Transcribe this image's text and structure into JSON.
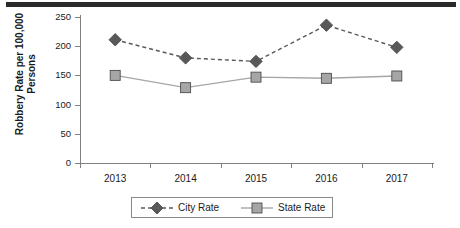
{
  "decor": {
    "top_bar_color": "#2b2b2b"
  },
  "chart_data": {
    "type": "line",
    "title": "",
    "xlabel": "",
    "ylabel": "Robbery Rate per 100,000 Persons",
    "ylabel_line1": "Robbery Rate per 100,000",
    "ylabel_line2": "Persons",
    "categories": [
      "2013",
      "2014",
      "2015",
      "2016",
      "2017"
    ],
    "ylim": [
      0,
      250
    ],
    "yticks": [
      0,
      50,
      100,
      150,
      200,
      250
    ],
    "ytick_labels": [
      "0",
      "50",
      "100",
      "150",
      "200",
      "250"
    ],
    "grid": false,
    "legend_position": "bottom",
    "series": [
      {
        "name": "City Rate",
        "values": [
          211,
          180,
          174,
          236,
          198
        ],
        "color": "#595959",
        "marker": "diamond",
        "line_style": "dashed"
      },
      {
        "name": "State Rate",
        "values": [
          150,
          129,
          147,
          145,
          149
        ],
        "color": "#a6a6a6",
        "marker": "square",
        "line_style": "solid"
      }
    ]
  },
  "legend": {
    "entries": [
      {
        "label": "City Rate"
      },
      {
        "label": "State Rate"
      }
    ]
  }
}
